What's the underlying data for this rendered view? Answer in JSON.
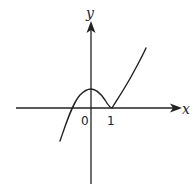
{
  "diagram": {
    "type": "function-graph",
    "axes": {
      "x_label": "x",
      "y_label": "y"
    },
    "tick_labels": {
      "origin": "0",
      "one": "1"
    },
    "curve": {
      "description": "cubic-like curve with local maximum on the y-axis and local minimum touching the x-axis at x = 1",
      "local_max": {
        "x": 0,
        "y": "positive"
      },
      "local_min": {
        "x": 1,
        "y": 0
      },
      "zero_crossing": "negative x, between -1 and 0"
    },
    "colors": {
      "stroke": "#222222",
      "background": "#ffffff"
    }
  }
}
